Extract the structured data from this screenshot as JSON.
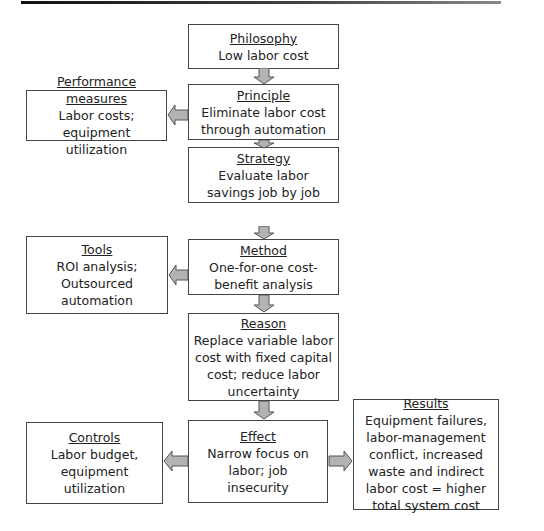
{
  "boxes": {
    "philosophy": {
      "title": "Philosophy",
      "body": "Low labor cost"
    },
    "principle": {
      "title": "Principle",
      "body": "Eliminate labor cost through automation"
    },
    "performance": {
      "title": "Performance measures",
      "body": "Labor costs; equipment utilization"
    },
    "strategy": {
      "title": "Strategy",
      "body": "Evaluate labor savings job by job"
    },
    "method": {
      "title": "Method",
      "body": "One-for-one cost-benefit analysis"
    },
    "tools": {
      "title": "Tools",
      "body": "ROI analysis; Outsourced automation"
    },
    "reason": {
      "title": "Reason",
      "body": "Replace variable labor cost with fixed capital cost; reduce labor uncertainty"
    },
    "effect": {
      "title": "Effect",
      "body": "Narrow focus on labor; job insecurity"
    },
    "controls": {
      "title": "Controls",
      "body": "Labor budget, equipment utilization"
    },
    "results": {
      "title": "Results",
      "body": "Equipment failures, labor-management conflict, increased waste and indirect labor cost = higher total system cost"
    }
  },
  "colors": {
    "arrow_fill": "#b3b3b3",
    "arrow_stroke": "#555555",
    "border": "#444444"
  }
}
